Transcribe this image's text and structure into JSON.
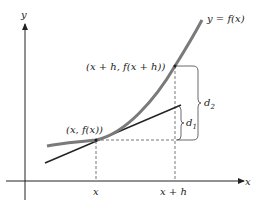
{
  "figure": {
    "axes": {
      "x_label": "x",
      "y_label": "y"
    },
    "curve_label": "y = f(x)",
    "points": {
      "p_label": "(x, f(x))",
      "q_label": "(x + h, f(x + h))"
    },
    "ticks": {
      "x1": "x",
      "x2": "x + h"
    },
    "brackets": {
      "d1": "d",
      "d1_sub": "1",
      "d2": "d",
      "d2_sub": "2"
    },
    "colors": {
      "curve": "#7a7a7a",
      "line": "#222222",
      "dashed": "#555555"
    }
  }
}
